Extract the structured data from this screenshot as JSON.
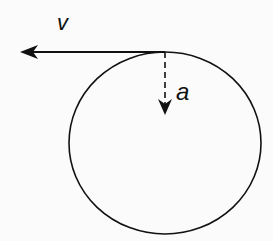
{
  "diagram": {
    "labels": {
      "velocity": "v",
      "acceleration": "a"
    },
    "elements": [
      {
        "type": "circle",
        "name": "circular-path"
      },
      {
        "type": "arrow",
        "name": "velocity-vector",
        "label": "v",
        "direction": "left",
        "style": "solid"
      },
      {
        "type": "arrow",
        "name": "acceleration-vector",
        "label": "a",
        "direction": "down",
        "style": "dashed"
      }
    ],
    "colors": {
      "stroke": "#111111",
      "background": "#fbfbfb"
    }
  }
}
